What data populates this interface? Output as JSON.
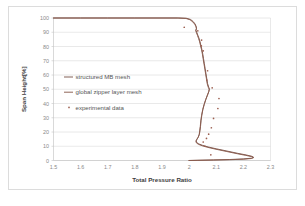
{
  "chart_data": {
    "type": "line",
    "title": "",
    "xlabel": "Total Pressure Ratio",
    "ylabel": "Span Height[%]",
    "xlim": [
      1.5,
      2.3
    ],
    "ylim": [
      0,
      100
    ],
    "xticks": [
      "1.5",
      "1.6",
      "1.7",
      "1.8",
      "1.9",
      "2",
      "2.1",
      "2.2",
      "2.3"
    ],
    "xtick_values": [
      1.5,
      1.6,
      1.7,
      1.8,
      1.9,
      2.0,
      2.1,
      2.2,
      2.3
    ],
    "yticks": [
      "0",
      "10",
      "20",
      "30",
      "40",
      "50",
      "60",
      "70",
      "80",
      "90",
      "100"
    ],
    "ytick_values": [
      0,
      10,
      20,
      30,
      40,
      50,
      60,
      70,
      80,
      90,
      100
    ],
    "grid": "horizontal",
    "legend_position": "center-left",
    "orientation": "x=pressure-ratio, y=span-height",
    "series": [
      {
        "name": "structured MB mesh",
        "type": "line",
        "color": "#7d584f",
        "points": [
          [
            1.5,
            100.0
          ],
          [
            1.6,
            100.0
          ],
          [
            1.7,
            100.0
          ],
          [
            1.8,
            100.0
          ],
          [
            1.9,
            100.0
          ],
          [
            1.96,
            100.0
          ],
          [
            1.99,
            99.8
          ],
          [
            2.005,
            99.0
          ],
          [
            2.015,
            97.5
          ],
          [
            2.022,
            95.8
          ],
          [
            2.026,
            94.0
          ],
          [
            2.027,
            92.6
          ],
          [
            2.025,
            91.5
          ],
          [
            2.028,
            90.0
          ],
          [
            2.032,
            88.0
          ],
          [
            2.036,
            86.0
          ],
          [
            2.04,
            83.5
          ],
          [
            2.043,
            81.0
          ],
          [
            2.047,
            78.0
          ],
          [
            2.05,
            75.0
          ],
          [
            2.053,
            71.5
          ],
          [
            2.056,
            68.0
          ],
          [
            2.059,
            64.5
          ],
          [
            2.062,
            61.0
          ],
          [
            2.065,
            57.5
          ],
          [
            2.068,
            54.0
          ],
          [
            2.072,
            51.5
          ],
          [
            2.075,
            50.3
          ],
          [
            2.073,
            48.5
          ],
          [
            2.068,
            46.0
          ],
          [
            2.062,
            43.0
          ],
          [
            2.056,
            39.5
          ],
          [
            2.051,
            36.0
          ],
          [
            2.047,
            32.0
          ],
          [
            2.044,
            28.0
          ],
          [
            2.042,
            24.0
          ],
          [
            2.04,
            21.0
          ],
          [
            2.038,
            18.5
          ],
          [
            2.034,
            16.5
          ],
          [
            2.029,
            15.0
          ],
          [
            2.026,
            13.8
          ],
          [
            2.028,
            12.6
          ],
          [
            2.036,
            11.6
          ],
          [
            2.05,
            10.6
          ],
          [
            2.07,
            9.5
          ],
          [
            2.1,
            8.2
          ],
          [
            2.14,
            6.6
          ],
          [
            2.18,
            5.0
          ],
          [
            2.21,
            3.9
          ],
          [
            2.232,
            2.9
          ],
          [
            2.238,
            2.2
          ],
          [
            2.23,
            1.6
          ],
          [
            2.2,
            1.1
          ],
          [
            2.15,
            0.7
          ],
          [
            2.09,
            0.4
          ],
          [
            2.03,
            0.15
          ],
          [
            2.0,
            0.0
          ]
        ]
      },
      {
        "name": "global zipper layer mesh",
        "type": "line",
        "color": "#8a5c4e",
        "points": [
          [
            1.5,
            100.0
          ],
          [
            1.6,
            100.0
          ],
          [
            1.7,
            100.0
          ],
          [
            1.8,
            100.0
          ],
          [
            1.9,
            100.0
          ],
          [
            1.958,
            100.0
          ],
          [
            1.988,
            99.7
          ],
          [
            2.003,
            98.8
          ],
          [
            2.014,
            97.2
          ],
          [
            2.021,
            95.5
          ],
          [
            2.026,
            93.7
          ],
          [
            2.027,
            92.3
          ],
          [
            2.024,
            91.2
          ],
          [
            2.027,
            89.7
          ],
          [
            2.031,
            87.7
          ],
          [
            2.035,
            85.6
          ],
          [
            2.039,
            83.2
          ],
          [
            2.042,
            80.6
          ],
          [
            2.046,
            77.6
          ],
          [
            2.049,
            74.6
          ],
          [
            2.052,
            71.1
          ],
          [
            2.055,
            67.6
          ],
          [
            2.058,
            64.1
          ],
          [
            2.061,
            60.6
          ],
          [
            2.064,
            57.1
          ],
          [
            2.067,
            53.6
          ],
          [
            2.071,
            51.2
          ],
          [
            2.074,
            50.0
          ],
          [
            2.072,
            48.2
          ],
          [
            2.067,
            45.7
          ],
          [
            2.061,
            42.7
          ],
          [
            2.055,
            39.2
          ],
          [
            2.05,
            35.7
          ],
          [
            2.046,
            31.7
          ],
          [
            2.043,
            27.7
          ],
          [
            2.041,
            23.7
          ],
          [
            2.039,
            20.7
          ],
          [
            2.037,
            18.2
          ],
          [
            2.033,
            16.2
          ],
          [
            2.028,
            14.7
          ],
          [
            2.025,
            13.5
          ],
          [
            2.027,
            12.3
          ],
          [
            2.035,
            11.3
          ],
          [
            2.049,
            10.3
          ],
          [
            2.069,
            9.2
          ],
          [
            2.099,
            7.9
          ],
          [
            2.139,
            6.3
          ],
          [
            2.179,
            4.7
          ],
          [
            2.209,
            3.6
          ],
          [
            2.231,
            2.7
          ],
          [
            2.237,
            2.0
          ],
          [
            2.229,
            1.4
          ],
          [
            2.199,
            0.9
          ],
          [
            2.149,
            0.55
          ],
          [
            2.089,
            0.3
          ],
          [
            2.029,
            0.1
          ],
          [
            1.999,
            0.0
          ]
        ]
      },
      {
        "name": "experimental data",
        "type": "scatter",
        "color": "#9c5f50",
        "marker": "dot",
        "points": [
          [
            1.982,
            93.5
          ],
          [
            2.032,
            91.0
          ],
          [
            2.046,
            84.5
          ],
          [
            2.045,
            80.5
          ],
          [
            2.052,
            77.0
          ],
          [
            2.068,
            63.0
          ],
          [
            2.065,
            56.5
          ],
          [
            2.085,
            51.0
          ],
          [
            2.11,
            43.5
          ],
          [
            2.106,
            36.5
          ],
          [
            2.09,
            29.5
          ],
          [
            2.082,
            23.0
          ],
          [
            2.072,
            18.5
          ],
          [
            2.064,
            15.5
          ],
          [
            2.052,
            13.0
          ],
          [
            2.058,
            10.0
          ],
          [
            2.08,
            4.0
          ]
        ]
      }
    ]
  },
  "legend": {
    "items": [
      {
        "label": "structured MB mesh",
        "marker": "line",
        "color": "#7d584f"
      },
      {
        "label": "global zipper layer mesh",
        "marker": "line",
        "color": "#8a5c4e"
      },
      {
        "label": "experimental data",
        "marker": "dot",
        "color": "#9c5f50"
      }
    ]
  },
  "axes": {
    "x_title": "Total Pressure Ratio",
    "y_title": "Span Height[%]"
  }
}
